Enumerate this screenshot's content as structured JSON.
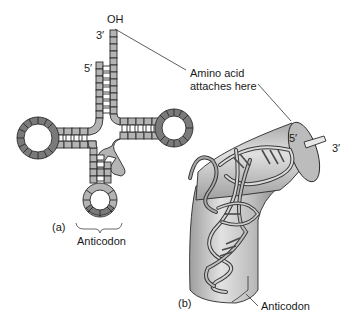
{
  "figure": {
    "panel_a": {
      "label": "(a)",
      "five_prime": "5′",
      "three_prime": "3′",
      "hydroxyl": "OH",
      "anticodon_label": "Anticodon"
    },
    "panel_b": {
      "label": "(b)",
      "five_prime": "5′",
      "three_prime": "3′",
      "anticodon_label": "Anticodon"
    },
    "callout": {
      "line1": "Amino acid",
      "line2": "attaches here"
    },
    "colors": {
      "stem_fill": "#b4b4b4",
      "loop_fill": "#7a7a7a",
      "outline": "#2a2a2a",
      "tube_fill": "#c8c8c8",
      "ribbon_fill": "#9a9a9a"
    }
  }
}
